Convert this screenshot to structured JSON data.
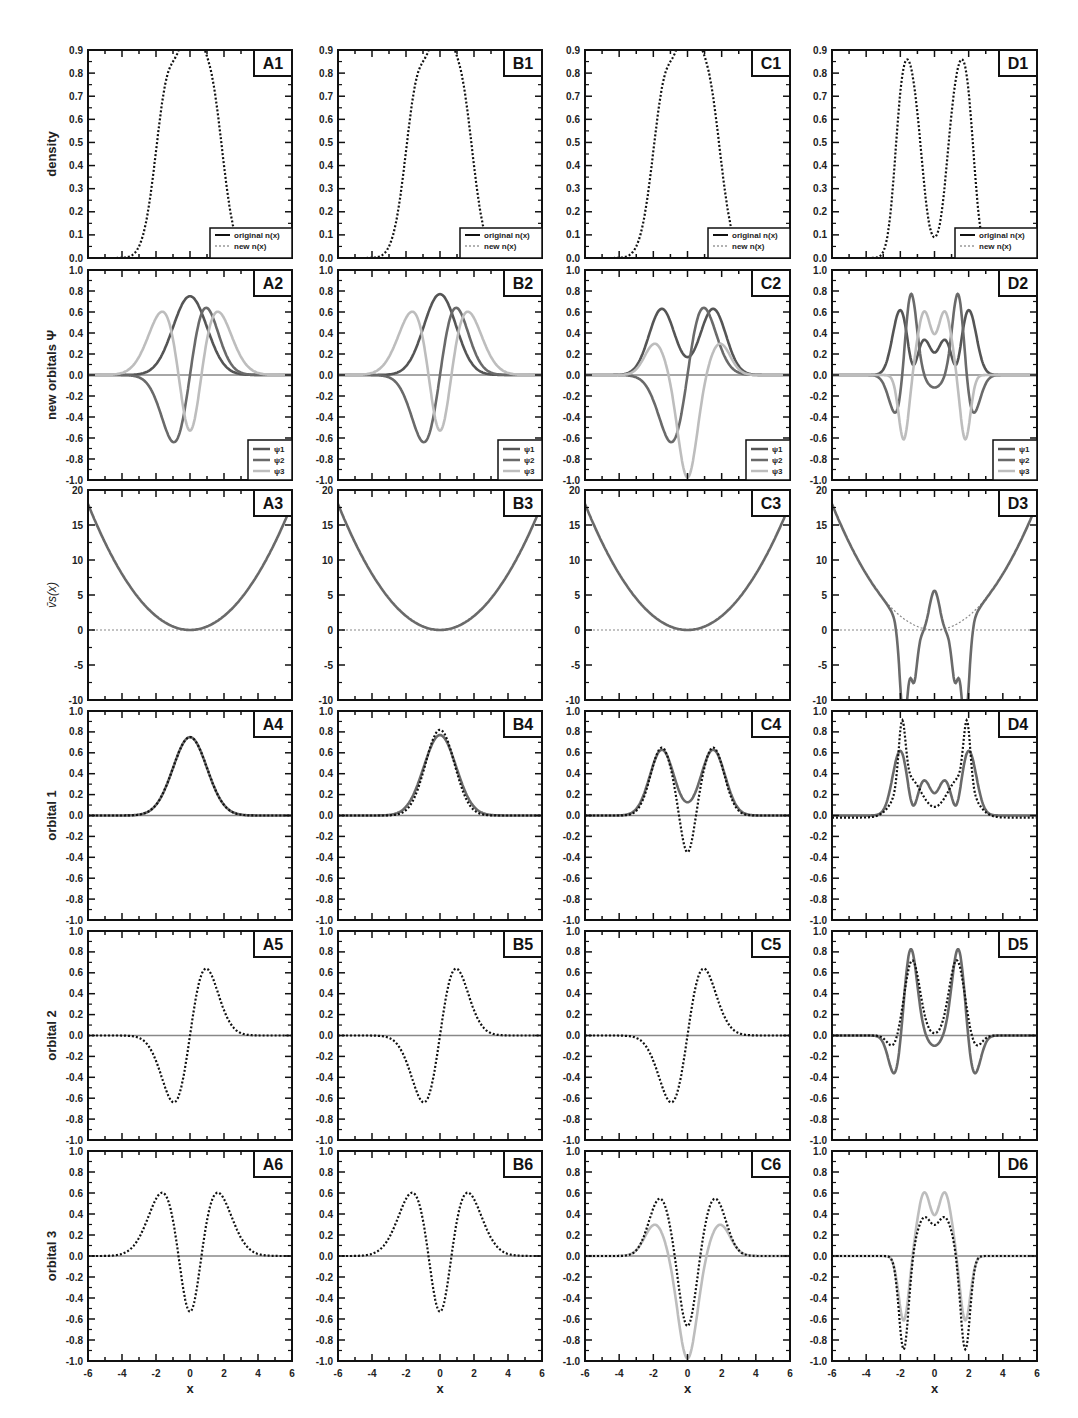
{
  "figure": {
    "columns": [
      "A",
      "B",
      "C",
      "D"
    ],
    "row_ylabels": [
      "density",
      "new orbitals Ψ",
      "v̄s(x)",
      "orbital 1",
      "orbital 2",
      "orbital 3"
    ],
    "xlabel": "x",
    "xticks": [
      "-6",
      "-4",
      "-2",
      "0",
      "2",
      "4",
      "6"
    ],
    "legend_density": [
      "original n(x)",
      "new n(x)"
    ],
    "legend_orbitals": [
      "ψ1",
      "ψ2",
      "ψ3"
    ],
    "colors": {
      "frame": "#111111",
      "dark_curve": "#555555",
      "mid_curve": "#6a6a6a",
      "light_curve": "#bdbdbd",
      "dotted": "#111111",
      "zero_line": "#888888"
    }
  },
  "chart_data": [
    {
      "panel": "A1",
      "type": "line",
      "ylabel": "density",
      "ylim": [
        0,
        0.9
      ],
      "yticks": [
        "0.0",
        "0.1",
        "0.2",
        "0.3",
        "0.4",
        "0.5",
        "0.6",
        "0.7",
        "0.8",
        "0.9"
      ],
      "xlim": [
        -6,
        6
      ],
      "series": [
        {
          "name": "original n(x)",
          "style": "solid"
        },
        {
          "name": "new n(x)",
          "style": "dotted"
        }
      ],
      "shape": "density3",
      "peaks": [
        {
          "x": -1.2,
          "y": 0.76
        },
        {
          "x": -0.1,
          "y": 0.84
        },
        {
          "x": 1.1,
          "y": 0.76
        }
      ],
      "dips": [
        {
          "x": -0.7,
          "y": 0.69
        },
        {
          "x": 0.6,
          "y": 0.69
        }
      ]
    },
    {
      "panel": "B1",
      "type": "line",
      "ylabel": "density",
      "ylim": [
        0,
        0.9
      ],
      "xlim": [
        -6,
        6
      ],
      "shape": "density3",
      "peaks": [
        {
          "x": -1.2,
          "y": 0.76
        },
        {
          "x": -0.1,
          "y": 0.84
        },
        {
          "x": 1.1,
          "y": 0.76
        }
      ]
    },
    {
      "panel": "C1",
      "type": "line",
      "ylabel": "density",
      "ylim": [
        0,
        0.9
      ],
      "xlim": [
        -6,
        6
      ],
      "shape": "density3",
      "peaks": [
        {
          "x": -1.2,
          "y": 0.76
        },
        {
          "x": -0.1,
          "y": 0.84
        },
        {
          "x": 1.1,
          "y": 0.76
        }
      ]
    },
    {
      "panel": "D1",
      "type": "line",
      "ylabel": "density",
      "ylim": [
        0,
        0.9
      ],
      "xlim": [
        -6,
        6
      ],
      "shape": "densityD",
      "peaks": [
        {
          "x": -1.8,
          "y": 0.77
        },
        {
          "x": 1.8,
          "y": 0.77
        }
      ],
      "dips": [
        {
          "x": 0,
          "y": 0.29
        }
      ],
      "shoulders": [
        {
          "x": -1.0,
          "y": 0.59
        },
        {
          "x": 1.0,
          "y": 0.59
        }
      ]
    },
    {
      "panel": "A2",
      "type": "line",
      "ylabel": "new orbitals Ψ",
      "ylim": [
        -1,
        1
      ],
      "yticks": [
        "-1.0",
        "-0.8",
        "-0.6",
        "-0.4",
        "-0.2",
        "0.0",
        "0.2",
        "0.4",
        "0.6",
        "0.8",
        "1.0"
      ],
      "xlim": [
        -6,
        6
      ],
      "series": [
        {
          "name": "ψ1",
          "peak": {
            "x": 0,
            "y": 0.75
          }
        },
        {
          "name": "ψ2",
          "min": {
            "x": -1,
            "y": -0.64
          },
          "max": {
            "x": 1,
            "y": 0.64
          }
        },
        {
          "name": "ψ3",
          "peaks": [
            {
              "x": -1.6,
              "y": 0.61
            },
            {
              "x": 1.6,
              "y": 0.61
            }
          ],
          "min": {
            "x": 0,
            "y": -0.53
          }
        }
      ]
    },
    {
      "panel": "B2",
      "type": "line",
      "ylabel": "new orbitals Ψ",
      "ylim": [
        -1,
        1
      ],
      "xlim": [
        -6,
        6
      ],
      "series": [
        {
          "name": "ψ1",
          "peak": {
            "x": 0,
            "y": 0.77
          }
        },
        {
          "name": "ψ2",
          "min": {
            "x": -1,
            "y": -0.64
          },
          "max": {
            "x": 1,
            "y": 0.64
          }
        },
        {
          "name": "ψ3",
          "peaks": [
            {
              "x": -1.6,
              "y": 0.61
            },
            {
              "x": 1.6,
              "y": 0.61
            }
          ],
          "min": {
            "x": 0,
            "y": -0.53
          }
        }
      ]
    },
    {
      "panel": "C2",
      "type": "line",
      "ylabel": "new orbitals Ψ",
      "ylim": [
        -1,
        1
      ],
      "xlim": [
        -6,
        6
      ],
      "series": [
        {
          "name": "ψ1",
          "peaks": [
            {
              "x": -1.6,
              "y": 0.63
            },
            {
              "x": 1.2,
              "y": 0.63
            }
          ]
        },
        {
          "name": "ψ2",
          "min": {
            "x": -1,
            "y": -0.64
          },
          "max": {
            "x": 1,
            "y": 0.64
          }
        },
        {
          "name": "ψ3",
          "peaks": [
            {
              "x": -1.9,
              "y": 0.23
            },
            {
              "x": 1.9,
              "y": 0.23
            }
          ],
          "min": {
            "x": 0,
            "y": -0.93
          }
        }
      ]
    },
    {
      "panel": "D2",
      "type": "line",
      "ylabel": "new orbitals Ψ",
      "ylim": [
        -1,
        1
      ],
      "xlim": [
        -6,
        6
      ],
      "series": [
        {
          "name": "ψ1",
          "peaks": [
            {
              "x": -2.0,
              "y": 0.71
            },
            {
              "x": 2.0,
              "y": 0.71
            }
          ],
          "mid": [
            {
              "x": -0.6,
              "y": 0.37
            },
            {
              "x": 0,
              "y": 0.29
            },
            {
              "x": 0.6,
              "y": 0.37
            }
          ]
        },
        {
          "name": "ψ2",
          "peaks": [
            {
              "x": -1.4,
              "y": 0.79
            },
            {
              "x": 1.4,
              "y": 0.79
            }
          ],
          "mins": [
            {
              "x": -2.2,
              "y": -0.37
            },
            {
              "x": 0,
              "y": -0.08
            },
            {
              "x": 2.2,
              "y": -0.37
            }
          ]
        },
        {
          "name": "ψ3",
          "peaks": [
            {
              "x": -0.6,
              "y": 0.65
            },
            {
              "x": 0.6,
              "y": 0.65
            }
          ],
          "mins": [
            {
              "x": -1.8,
              "y": -0.6
            },
            {
              "x": 1.8,
              "y": -0.6
            }
          ]
        }
      ]
    },
    {
      "panel": "A3",
      "type": "line",
      "ylabel": "v̄s(x)",
      "ylim": [
        -10,
        20
      ],
      "yticks": [
        "-10",
        "-5",
        "0",
        "5",
        "10",
        "15",
        "20"
      ],
      "xlim": [
        -6,
        6
      ],
      "series": [
        {
          "name": "vs",
          "shape": "parabola 0.5x²",
          "min": {
            "x": 0,
            "y": 0
          }
        }
      ]
    },
    {
      "panel": "B3",
      "type": "line",
      "ylabel": "v̄s(x)",
      "ylim": [
        -10,
        20
      ],
      "xlim": [
        -6,
        6
      ],
      "series": [
        {
          "name": "vs",
          "shape": "parabola",
          "min": {
            "x": 0,
            "y": 0
          }
        }
      ]
    },
    {
      "panel": "C3",
      "type": "line",
      "ylabel": "v̄s(x)",
      "ylim": [
        -10,
        20
      ],
      "xlim": [
        -6,
        6
      ],
      "series": [
        {
          "name": "vs",
          "shape": "parabola",
          "min": {
            "x": 0,
            "y": 0
          }
        }
      ]
    },
    {
      "panel": "D3",
      "type": "line",
      "ylabel": "v̄s(x)",
      "ylim": [
        -10,
        20
      ],
      "xlim": [
        -6,
        6
      ],
      "series": [
        {
          "name": "vs",
          "peak": {
            "x": 0,
            "y": 5.8
          },
          "mins": [
            {
              "x": -1.8,
              "y": -9.8
            },
            {
              "x": -1.2,
              "y": -4.6
            },
            {
              "x": 1.2,
              "y": -4.6
            },
            {
              "x": 1.8,
              "y": -9.8
            }
          ]
        },
        {
          "name": "harmonic (dotted)",
          "shape": "parabola"
        }
      ]
    },
    {
      "panel": "A4",
      "type": "line",
      "ylabel": "orbital 1",
      "ylim": [
        -1,
        1
      ],
      "xlim": [
        -6,
        6
      ],
      "series": [
        {
          "name": "solid",
          "peak": {
            "x": 0,
            "y": 0.75
          }
        },
        {
          "name": "dotted",
          "peak": {
            "x": 0,
            "y": 0.75
          }
        }
      ]
    },
    {
      "panel": "B4",
      "type": "line",
      "ylabel": "orbital 1",
      "ylim": [
        -1,
        1
      ],
      "xlim": [
        -6,
        6
      ],
      "series": [
        {
          "name": "solid",
          "peak": {
            "x": 0,
            "y": 0.77
          }
        },
        {
          "name": "dotted",
          "peak": {
            "x": 0,
            "y": 0.82
          }
        }
      ]
    },
    {
      "panel": "C4",
      "type": "line",
      "ylabel": "orbital 1",
      "ylim": [
        -1,
        1
      ],
      "xlim": [
        -6,
        6
      ],
      "series": [
        {
          "name": "solid",
          "peaks": [
            {
              "x": -1.5,
              "y": 0.63
            },
            {
              "x": 1.5,
              "y": 0.63
            }
          ],
          "min": {
            "x": 0,
            "y": 0.02
          }
        },
        {
          "name": "dotted",
          "peaks": [
            {
              "x": -1.5,
              "y": 0.63
            },
            {
              "x": 1.5,
              "y": 0.63
            }
          ],
          "min": {
            "x": 0,
            "y": -0.42
          }
        }
      ]
    },
    {
      "panel": "D4",
      "type": "line",
      "ylabel": "orbital 1",
      "ylim": [
        -1,
        1
      ],
      "xlim": [
        -6,
        6
      ],
      "series": [
        {
          "name": "solid",
          "peaks": [
            {
              "x": -2,
              "y": 0.71
            },
            {
              "x": 2,
              "y": 0.71
            }
          ],
          "mid": [
            {
              "x": -0.6,
              "y": 0.37
            },
            {
              "x": 0,
              "y": 0.29
            },
            {
              "x": 0.6,
              "y": 0.37
            }
          ]
        },
        {
          "name": "dotted",
          "peaks": [
            {
              "x": -1.9,
              "y": 0.89
            },
            {
              "x": 1.9,
              "y": 0.89
            }
          ],
          "min": {
            "x": 0,
            "y": 0.09
          }
        }
      ]
    },
    {
      "panel": "A5",
      "type": "line",
      "ylabel": "orbital 2",
      "ylim": [
        -1,
        1
      ],
      "xlim": [
        -6,
        6
      ],
      "series": [
        {
          "name": "solid",
          "min": {
            "x": -1,
            "y": -0.64
          },
          "max": {
            "x": 1,
            "y": 0.65
          }
        },
        {
          "name": "dotted",
          "min": {
            "x": -1,
            "y": -0.64
          },
          "max": {
            "x": 1,
            "y": 0.65
          }
        }
      ]
    },
    {
      "panel": "B5",
      "type": "line",
      "ylabel": "orbital 2",
      "ylim": [
        -1,
        1
      ],
      "xlim": [
        -6,
        6
      ],
      "series": [
        {
          "name": "solid",
          "min": {
            "x": -1,
            "y": -0.64
          },
          "max": {
            "x": 1,
            "y": 0.65
          }
        },
        {
          "name": "dotted",
          "min": {
            "x": -1,
            "y": -0.64
          },
          "max": {
            "x": 1,
            "y": 0.65
          }
        }
      ]
    },
    {
      "panel": "C5",
      "type": "line",
      "ylabel": "orbital 2",
      "ylim": [
        -1,
        1
      ],
      "xlim": [
        -6,
        6
      ],
      "series": [
        {
          "name": "solid",
          "min": {
            "x": -1,
            "y": -0.64
          },
          "max": {
            "x": 1,
            "y": 0.65
          }
        },
        {
          "name": "dotted",
          "min": {
            "x": -1,
            "y": -0.64
          },
          "max": {
            "x": 1,
            "y": 0.65
          }
        }
      ]
    },
    {
      "panel": "D5",
      "type": "line",
      "ylabel": "orbital 2",
      "ylim": [
        -1,
        1
      ],
      "xlim": [
        -6,
        6
      ],
      "series": [
        {
          "name": "solid",
          "peaks": [
            {
              "x": -1.4,
              "y": 0.8
            },
            {
              "x": 1.4,
              "y": 0.8
            }
          ],
          "mins": [
            {
              "x": -2.3,
              "y": -0.37
            },
            {
              "x": 0,
              "y": -0.07
            },
            {
              "x": 2.3,
              "y": -0.37
            }
          ]
        },
        {
          "name": "dotted",
          "peaks": [
            {
              "x": -1.3,
              "y": 0.73
            },
            {
              "x": 1.3,
              "y": 0.73
            }
          ],
          "mins": [
            {
              "x": -2.4,
              "y": -0.1
            },
            {
              "x": 0,
              "y": 0.02
            },
            {
              "x": 2.4,
              "y": -0.1
            }
          ]
        }
      ]
    },
    {
      "panel": "A6",
      "type": "line",
      "ylabel": "orbital 3",
      "ylim": [
        -1,
        1
      ],
      "xlim": [
        -6,
        6
      ],
      "xlabel": "x",
      "series": [
        {
          "name": "dotted",
          "peaks": [
            {
              "x": -1.6,
              "y": 0.61
            },
            {
              "x": 1.6,
              "y": 0.61
            }
          ],
          "min": {
            "x": 0,
            "y": -0.53
          }
        }
      ]
    },
    {
      "panel": "B6",
      "type": "line",
      "ylabel": "orbital 3",
      "ylim": [
        -1,
        1
      ],
      "xlim": [
        -6,
        6
      ],
      "xlabel": "x",
      "series": [
        {
          "name": "dotted",
          "peaks": [
            {
              "x": -1.6,
              "y": 0.61
            },
            {
              "x": 1.6,
              "y": 0.61
            }
          ],
          "min": {
            "x": 0,
            "y": -0.53
          }
        }
      ]
    },
    {
      "panel": "C6",
      "type": "line",
      "ylabel": "orbital 3",
      "ylim": [
        -1,
        1
      ],
      "xlim": [
        -6,
        6
      ],
      "xlabel": "x",
      "series": [
        {
          "name": "solid (light)",
          "peaks": [
            {
              "x": -1.9,
              "y": 0.23
            },
            {
              "x": 1.9,
              "y": 0.23
            }
          ],
          "min": {
            "x": 0,
            "y": -0.93
          }
        },
        {
          "name": "dotted",
          "peaks": [
            {
              "x": -1.6,
              "y": 0.54
            },
            {
              "x": 1.6,
              "y": 0.54
            }
          ],
          "min": {
            "x": 0,
            "y": -0.7
          }
        }
      ]
    },
    {
      "panel": "D6",
      "type": "line",
      "ylabel": "orbital 3",
      "ylim": [
        -1,
        1
      ],
      "xlim": [
        -6,
        6
      ],
      "xlabel": "x",
      "series": [
        {
          "name": "solid (light)",
          "peaks": [
            {
              "x": -0.6,
              "y": 0.65
            },
            {
              "x": 0.6,
              "y": 0.65
            }
          ],
          "mins": [
            {
              "x": -1.8,
              "y": -0.6
            },
            {
              "x": 1.8,
              "y": -0.6
            }
          ]
        },
        {
          "name": "dotted",
          "peaks": [
            {
              "x": -0.6,
              "y": 0.38
            },
            {
              "x": 0.6,
              "y": 0.38
            }
          ],
          "mins": [
            {
              "x": -1.8,
              "y": -0.87
            },
            {
              "x": 1.8,
              "y": -0.87
            }
          ]
        }
      ]
    }
  ]
}
